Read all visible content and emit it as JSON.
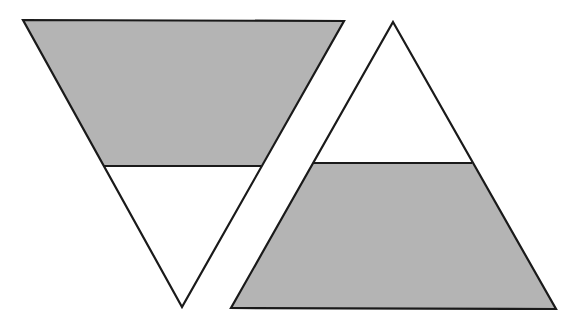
{
  "diagram": {
    "colors": {
      "background": "#ffffff",
      "shade": "#b4b4b4",
      "stroke": "#1a1a1a",
      "unshaded": "#ffffff"
    },
    "shapes": [
      {
        "name": "inverted-triangle",
        "orientation": "pointing-down",
        "vertices": [
          [
            23,
            20
          ],
          [
            344,
            21
          ],
          [
            182,
            307
          ]
        ],
        "divider": {
          "y": 166,
          "x1": 104,
          "x2": 261
        },
        "shaded_region": "top-trapezoid",
        "unshaded_region": "bottom-small-triangle"
      },
      {
        "name": "upright-triangle",
        "orientation": "pointing-up",
        "vertices": [
          [
            393,
            22
          ],
          [
            556,
            309
          ],
          [
            231,
            308
          ]
        ],
        "divider": {
          "y": 163,
          "x1": 313,
          "x2": 472
        },
        "shaded_region": "bottom-trapezoid",
        "unshaded_region": "top-small-triangle"
      }
    ]
  }
}
